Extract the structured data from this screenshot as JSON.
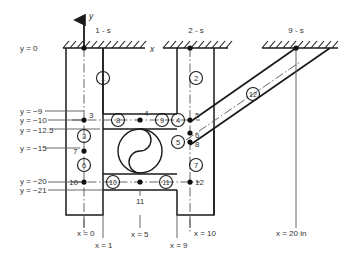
{
  "diagram": {
    "axes": {
      "y_axis_label": "y",
      "x_axis_label": "x",
      "unit_note": "in"
    },
    "supports": [
      {
        "name": "1 - s",
        "x": 103,
        "y": 30
      },
      {
        "name": "2 - s",
        "x": 196,
        "y": 30
      },
      {
        "name": "9 - s",
        "x": 296,
        "y": 30
      }
    ],
    "y_labels": [
      {
        "text": "y = 0",
        "x": 20,
        "y": 48
      },
      {
        "text": "y = −9",
        "x": 20,
        "y": 112
      },
      {
        "text": "y = −10",
        "x": 20,
        "y": 121
      },
      {
        "text": "y = −12.5",
        "x": 20,
        "y": 131
      },
      {
        "text": "y = −15",
        "x": 20,
        "y": 149
      },
      {
        "text": "y = −20",
        "x": 20,
        "y": 180
      },
      {
        "text": "y = −21",
        "x": 20,
        "y": 190
      }
    ],
    "x_labels": [
      {
        "text": "x = 0",
        "x": 77,
        "y": 234
      },
      {
        "text": "x = 1",
        "x": 95,
        "y": 246
      },
      {
        "text": "x = 5",
        "x": 133,
        "y": 235
      },
      {
        "text": "x = 9",
        "x": 174,
        "y": 246
      },
      {
        "text": "x = 10",
        "x": 193,
        "y": 234
      },
      {
        "text": "x = 20 in",
        "x": 289,
        "y": 234
      }
    ],
    "nodes": [
      {
        "id": "3",
        "label": "3",
        "x": 84,
        "y": 120,
        "label_dx": 4,
        "label_dy": -3
      },
      {
        "id": "4",
        "label": "4",
        "x": 140,
        "y": 120,
        "label_dx": 3,
        "label_dy": -4
      },
      {
        "id": "5",
        "label": "5",
        "x": 190,
        "y": 120,
        "label_dx": 4,
        "label_dy": -3
      },
      {
        "id": "6",
        "label": "6",
        "x": 190,
        "y": 133,
        "label_dx": 4,
        "label_dy": 5
      },
      {
        "id": "8",
        "label": "8",
        "x": 190,
        "y": 142,
        "label_dx": 4,
        "label_dy": 4
      },
      {
        "id": "7",
        "label": "7",
        "x": 84,
        "y": 151,
        "label_dx": -9,
        "label_dy": 2
      },
      {
        "id": "10",
        "label": "10",
        "x": 84,
        "y": 182,
        "label_dx": -13,
        "label_dy": 3
      },
      {
        "id": "11",
        "label": "11",
        "x": 140,
        "y": 182,
        "label_dx": 0,
        "label_dy": 0
      },
      {
        "id": "12",
        "label": "12",
        "x": 190,
        "y": 182,
        "label_dx": 4,
        "label_dy": 3
      }
    ],
    "node_11_leader_label": {
      "text": "11",
      "x": 136,
      "y": 202
    },
    "elements": [
      {
        "id": "1",
        "x": 103,
        "y": 78
      },
      {
        "id": "2",
        "x": 196,
        "y": 78
      },
      {
        "id": "3",
        "x": 84,
        "y": 136
      },
      {
        "id": "4",
        "x": 178,
        "y": 120
      },
      {
        "id": "5",
        "x": 178,
        "y": 142
      },
      {
        "id": "6",
        "x": 84,
        "y": 165
      },
      {
        "id": "7",
        "x": 196,
        "y": 165
      },
      {
        "id": "8",
        "x": 118,
        "y": 120
      },
      {
        "id": "9",
        "x": 162,
        "y": 120
      },
      {
        "id": "10",
        "x": 113,
        "y": 182
      },
      {
        "id": "11",
        "x": 166,
        "y": 182
      },
      {
        "id": "12",
        "x": 253,
        "y": 94
      }
    ],
    "colors": {
      "line": "#1a1a1a",
      "thin": "#555555",
      "text": "#333333",
      "background": "#ffffff"
    }
  }
}
